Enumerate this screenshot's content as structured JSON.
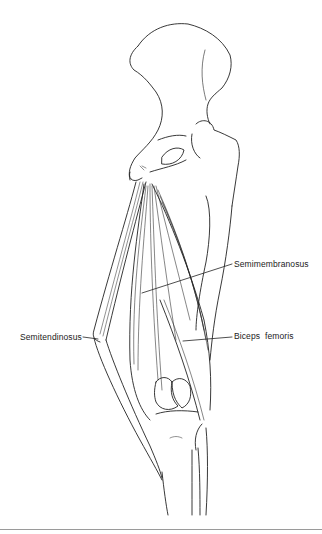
{
  "figure": {
    "labels": {
      "semimembranosus": "Semimembranosus",
      "semitendinosus": "Semitendinosus",
      "biceps_femoris": "Biceps  femoris"
    }
  }
}
